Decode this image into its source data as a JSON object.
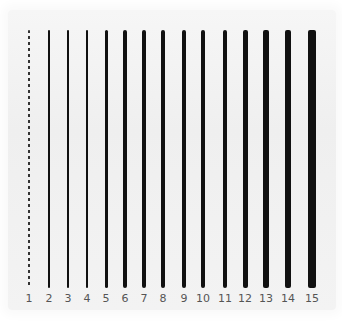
{
  "strokes": [
    {
      "label": "1",
      "x": 29,
      "width": 1.2,
      "style": "dashed"
    },
    {
      "label": "2",
      "x": 49,
      "width": 1.5,
      "style": "solid"
    },
    {
      "label": "3",
      "x": 68,
      "width": 2,
      "style": "solid"
    },
    {
      "label": "4",
      "x": 87,
      "width": 2.5,
      "style": "solid"
    },
    {
      "label": "5",
      "x": 106,
      "width": 3,
      "style": "solid"
    },
    {
      "label": "6",
      "x": 125,
      "width": 3.2,
      "style": "solid"
    },
    {
      "label": "7",
      "x": 144,
      "width": 3.4,
      "style": "solid"
    },
    {
      "label": "8",
      "x": 163,
      "width": 3.6,
      "style": "solid"
    },
    {
      "label": "9",
      "x": 184,
      "width": 3.8,
      "style": "solid"
    },
    {
      "label": "10",
      "x": 203,
      "width": 4,
      "style": "solid"
    },
    {
      "label": "11",
      "x": 225,
      "width": 4.5,
      "style": "solid"
    },
    {
      "label": "12",
      "x": 245,
      "width": 5,
      "style": "solid"
    },
    {
      "label": "13",
      "x": 266,
      "width": 5.5,
      "style": "solid"
    },
    {
      "label": "14",
      "x": 288,
      "width": 6.5,
      "style": "solid"
    },
    {
      "label": "15",
      "x": 312,
      "width": 8,
      "style": "solid"
    }
  ],
  "colors": {
    "stroke": "#111111",
    "label": "#555555",
    "paper": "#f2f2f2"
  }
}
